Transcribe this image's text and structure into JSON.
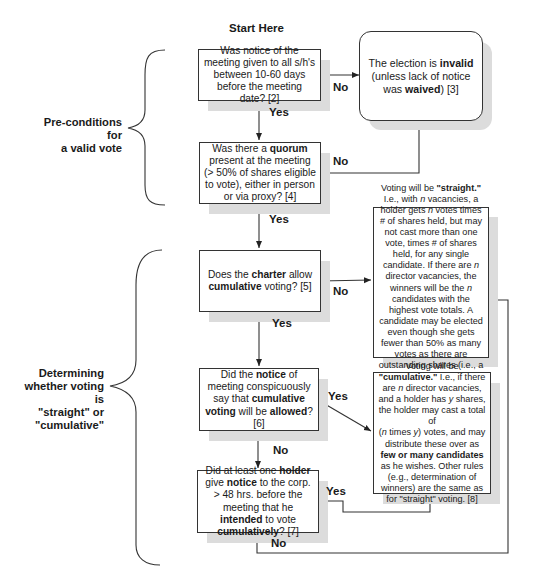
{
  "title": "Start Here",
  "sections": [
    {
      "id": "preconditions",
      "label_lines": [
        "Pre-conditions for",
        "a valid vote"
      ]
    },
    {
      "id": "determining",
      "label_lines": [
        "Determining",
        "whether voting is",
        "\"straight\" or",
        "\"cumulative\""
      ]
    }
  ],
  "nodes": {
    "notice": {
      "parts": [
        "Was notice of the meeting given to all s/h's between 10-60 days before the meeting date? [2]"
      ]
    },
    "invalid": {
      "t1": "The election is ",
      "b1": "invalid",
      "t2": "(unless lack of notice was ",
      "b2": "waived",
      "t3": ") [3]"
    },
    "quorum": {
      "t1": "Was there a ",
      "b1": "quorum",
      "t2": " present at the meeting (> 50% of shares eligible to vote), either in person or via proxy? [4]"
    },
    "charter": {
      "t1": "Does the ",
      "b1": "charter",
      "t2": " allow ",
      "b2": "cumulative",
      "t3": " voting? [5]"
    },
    "straight": {
      "t1": "Voting will be ",
      "b1": "\"straight.\"",
      "t2": " I.e., with ",
      "i1": "n",
      "t3": " vacancies, a holder gets ",
      "i2": "n",
      "t4": " votes times # of shares held, but may not cast more than one vote, times # of shares held, for any single candidate. If there are ",
      "i3": "n",
      "t5": " director vacancies, the winners will be the ",
      "i4": "n",
      "t6": " candidates with the highest vote totals. A candidate may be elected even though she gets fewer than 50% as many votes as there are outstanding shares (i.e., a plurality is enough)."
    },
    "meeting_notice": {
      "t1": "Did the ",
      "b1": "notice",
      "t2": " of meeting conspicuously say that ",
      "b2": "cumulative voting",
      "t3": " will be ",
      "b3": "allowed",
      "t4": "? [6]"
    },
    "cumulative": {
      "t1": "Voting will be ",
      "b1": "\"cumulative.\"",
      "t2": " I.e., if there are ",
      "i1": "n",
      "t3": " director vacancies, and a holder has ",
      "i2": "y",
      "t4": " shares, the holder may cast a total of",
      "t5": "(",
      "i3": "n",
      "t6": " times ",
      "i4": "y",
      "t7": ") votes, and may distribute  these over as ",
      "b2": "few or many candidates",
      "t8": " as he wishes. Other rules (e.g., determination of winners) are the same as for \"straight\" voting. [8]"
    },
    "holder": {
      "t1": "Did at least one ",
      "b1": "holder",
      "t2": " give ",
      "b2": "notice",
      "t3": " to the corp. > 48 hrs. before the meeting that he ",
      "b3": "intended",
      "t4": " to vote ",
      "b4": "cumulatively",
      "t5": "? [7]"
    }
  },
  "edge_labels": {
    "notice_no": "No",
    "notice_yes": "Yes",
    "quorum_no": "No",
    "quorum_yes": "Yes",
    "charter_no": "No",
    "charter_yes": "Yes",
    "meeting_notice_yes": "Yes",
    "meeting_notice_no": "No",
    "holder_yes": "Yes",
    "holder_no": "No"
  }
}
